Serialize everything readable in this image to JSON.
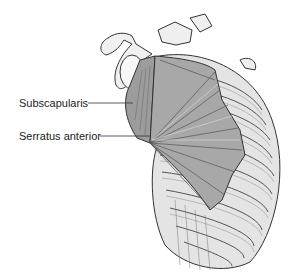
{
  "figure": {
    "labels": [
      {
        "text": "Subscapularis",
        "x": 19,
        "y": 97,
        "line_end_x": 133,
        "line_y": 104
      },
      {
        "text": "Serratus anterior",
        "x": 19,
        "y": 130,
        "line_end_x": 150,
        "line_y": 137
      }
    ]
  },
  "colors": {
    "background": "#ffffff",
    "text": "#222222",
    "bone": "#ececec",
    "muscle": "#9a9a9a",
    "outline": "#333333"
  }
}
